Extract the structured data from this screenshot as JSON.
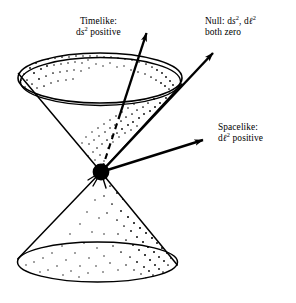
{
  "figure": {
    "background_color": "#ffffff",
    "ink_color": "#000000",
    "width": 296,
    "height": 303
  },
  "labels": {
    "timelike": {
      "line1": "Timelike:",
      "line2_prefix": "d",
      "line2_var": "s",
      "line2_sup": "2",
      "line2_suffix": " positive",
      "line2_plain": "ds2 positive"
    },
    "null": {
      "line1_prefix": "Null: d",
      "line1_var1": "s",
      "line1_sup1": "2",
      "line1_mid": ", d",
      "line1_var2": "ℓ",
      "line1_sup2": "2",
      "line1_plain": "Null: ds2, dℓ2",
      "line2": "both zero"
    },
    "spacelike": {
      "line1": "Spacelike:",
      "line2_prefix": "d",
      "line2_var": "ℓ",
      "line2_sup": "2",
      "line2_suffix": " positive",
      "line2_plain": "dℓ2 positive"
    }
  },
  "geometry": {
    "vertex": {
      "x": 101,
      "y": 172,
      "radius": 8.5
    },
    "upper_cone": {
      "rim_center_x": 100,
      "rim_center_y": 78,
      "rim_rx": 82,
      "rim_ry": 25,
      "rim_thickness": 4,
      "stipple_density": "high-left-and-right"
    },
    "lower_cone": {
      "base_center_x": 97.5,
      "base_center_y": 262,
      "base_rx": 80,
      "base_ry": 20,
      "stipple_density": "high-right"
    },
    "arrows": [
      {
        "name": "timelike-arrow",
        "from_x": 101,
        "from_y": 172,
        "to_x": 150,
        "to_y": 25,
        "dashed_until_x": 118,
        "dashed_until_y": 120,
        "style": "dashed-then-solid"
      },
      {
        "name": "null-arrow",
        "from_x": 101,
        "from_y": 172,
        "to_x": 217,
        "to_y": 48,
        "style": "solid"
      },
      {
        "name": "spacelike-arrow",
        "from_x": 101,
        "from_y": 172,
        "to_x": 208,
        "to_y": 138,
        "style": "solid"
      }
    ]
  }
}
